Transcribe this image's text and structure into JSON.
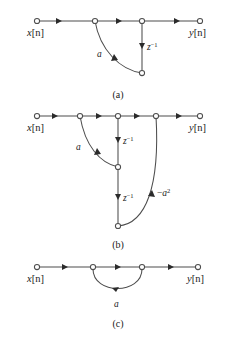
{
  "figure": {
    "background_color": "#ffffff",
    "line_color": "#4d4d4d",
    "arrow_color": "#2b2b2b",
    "text_color": "#1a1a1a",
    "panels": [
      {
        "id": "a",
        "caption": "(a)",
        "input_label_var": "x",
        "input_label_index": "[n]",
        "output_label_var": "y",
        "output_label_index": "[n]",
        "gain_label": "a",
        "delay_label_base": "z",
        "delay_label_exponent": "−1",
        "node_count": 5,
        "branches": [
          {
            "name": "input-to-sum",
            "type": "straight",
            "gain": "1"
          },
          {
            "name": "sum-to-output-node",
            "type": "straight",
            "gain": "1"
          },
          {
            "name": "output-node-to-output",
            "type": "straight",
            "gain": "1"
          },
          {
            "name": "delay-branch",
            "type": "straight",
            "gain": "z⁻¹"
          },
          {
            "name": "feedback-gain-branch",
            "type": "curve",
            "gain": "a"
          }
        ]
      },
      {
        "id": "b",
        "caption": "(b)",
        "input_label_var": "x",
        "input_label_index": "[n]",
        "output_label_var": "y",
        "output_label_index": "[n]",
        "gain_label_1": "a",
        "gain_label_2_sign": "−",
        "gain_label_2_base": "a",
        "gain_label_2_exponent": "2",
        "delay_label_1_base": "z",
        "delay_label_1_exponent": "−1",
        "delay_label_2_base": "z",
        "delay_label_2_exponent": "−1",
        "node_count": 7,
        "branches": [
          {
            "name": "input-to-sum1",
            "type": "straight",
            "gain": "1"
          },
          {
            "name": "sum1-to-sum2",
            "type": "straight",
            "gain": "1"
          },
          {
            "name": "sum2-to-sum3",
            "type": "straight",
            "gain": "1"
          },
          {
            "name": "sum3-to-output",
            "type": "straight",
            "gain": "1"
          },
          {
            "name": "delay1-branch",
            "type": "straight",
            "gain": "z⁻¹"
          },
          {
            "name": "delay2-branch",
            "type": "straight",
            "gain": "z⁻¹"
          },
          {
            "name": "feedback-gain-a",
            "type": "curve",
            "gain": "a"
          },
          {
            "name": "feedback-gain-neg-a-squared",
            "type": "curve",
            "gain": "−a²"
          }
        ]
      },
      {
        "id": "c",
        "caption": "(c)",
        "input_label_var": "x",
        "input_label_index": "[n]",
        "output_label_var": "y",
        "output_label_index": "[n]",
        "gain_label": "a",
        "node_count": 4,
        "branches": [
          {
            "name": "input-to-node1",
            "type": "straight",
            "gain": "1"
          },
          {
            "name": "node1-to-node2",
            "type": "straight",
            "gain": "1"
          },
          {
            "name": "node2-to-output",
            "type": "straight",
            "gain": "1"
          },
          {
            "name": "feedback-loop-gain",
            "type": "curve",
            "gain": "a"
          }
        ]
      }
    ]
  }
}
